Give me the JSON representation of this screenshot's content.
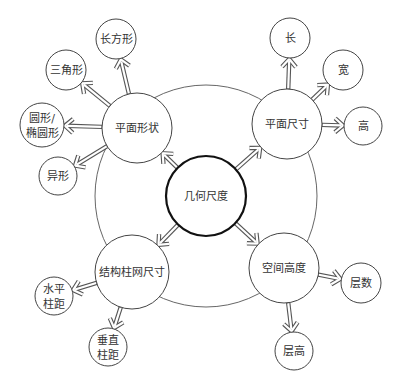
{
  "diagram": {
    "type": "mind-map",
    "ring": {
      "cx": 206,
      "cy": 196,
      "r": 111
    },
    "center": {
      "label": "几何尺度",
      "cx": 206,
      "cy": 196,
      "r": 40
    },
    "branches": [
      {
        "label": "平面形状",
        "cx": 137,
        "cy": 128,
        "r": 35,
        "children": [
          {
            "label": "长方形",
            "cx": 116,
            "cy": 39,
            "r": 20
          },
          {
            "label": "三角形",
            "cx": 66,
            "cy": 70,
            "r": 20
          },
          {
            "label": "圆形/\n椭圆形",
            "line1": "圆形/",
            "line2": "椭圆形",
            "cx": 42,
            "cy": 125,
            "r": 22
          },
          {
            "label": "异形",
            "cx": 58,
            "cy": 176,
            "r": 19
          }
        ]
      },
      {
        "label": "平面尺寸",
        "cx": 287,
        "cy": 124,
        "r": 35,
        "children": [
          {
            "label": "长",
            "cx": 290,
            "cy": 38,
            "r": 20
          },
          {
            "label": "宽",
            "cx": 343,
            "cy": 70,
            "r": 20
          },
          {
            "label": "高",
            "cx": 363,
            "cy": 126,
            "r": 19
          }
        ]
      },
      {
        "label": "结构柱网尺寸",
        "cx": 132,
        "cy": 272,
        "r": 37,
        "children": [
          {
            "label": "水平柱距",
            "line1": "水平",
            "line2": "柱距",
            "cx": 54,
            "cy": 296,
            "r": 19
          },
          {
            "label": "垂直柱距",
            "line1": "垂直",
            "line2": "柱距",
            "cx": 108,
            "cy": 347,
            "r": 19
          }
        ]
      },
      {
        "label": "空间高度",
        "cx": 284,
        "cy": 268,
        "r": 35,
        "children": [
          {
            "label": "层数",
            "cx": 361,
            "cy": 283,
            "r": 20
          },
          {
            "label": "层高",
            "cx": 294,
            "cy": 351,
            "r": 19
          }
        ]
      }
    ]
  }
}
